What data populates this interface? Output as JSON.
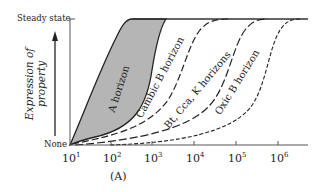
{
  "figure": {
    "panel_label": "(A)",
    "y_axis": {
      "top_label": "Steady state",
      "bottom_label": "None",
      "title_line1": "Expression of",
      "title_line2": "property"
    },
    "x_axis": {
      "ticks": [
        {
          "base": "10",
          "exp": "1"
        },
        {
          "base": "10",
          "exp": "2"
        },
        {
          "base": "10",
          "exp": "3"
        },
        {
          "base": "10",
          "exp": "4"
        },
        {
          "base": "10",
          "exp": "5"
        },
        {
          "base": "10",
          "exp": "6"
        }
      ]
    },
    "curves": {
      "a_horizon": "A horizon",
      "cambic": "Cambic B horizon",
      "bt": "Bt, Cca, K horizons",
      "oxic": "Oxic B horizon"
    },
    "colors": {
      "shade": "#b5b5b5",
      "ink": "#222222"
    }
  }
}
